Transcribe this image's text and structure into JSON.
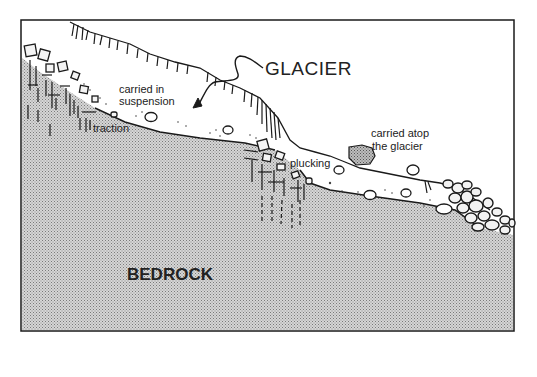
{
  "diagram": {
    "labels": {
      "glacier": "GLACIER",
      "bedrock": "BEDROCK",
      "carried_in_suspension_line1": "carried in",
      "carried_in_suspension_line2": "suspension",
      "traction": "traction",
      "plucking": "plucking",
      "carried_atop_line1": "carried atop",
      "carried_atop_line2": "the glacier"
    },
    "colors": {
      "line": "#1a1a1a",
      "bedrock_fill": "#c8c8c8",
      "glacier_fill": "#ffffff",
      "boulder_atop_fill": "#9a9a9a",
      "background": "#ffffff"
    }
  }
}
